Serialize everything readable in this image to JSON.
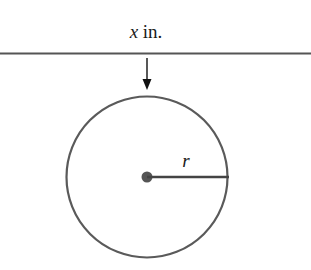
{
  "diagram": {
    "top_label_var": "x",
    "top_label_unit": " in.",
    "radius_label": "r",
    "colors": {
      "line": "#555555",
      "arrow": "#111111",
      "circle": "#5a5a5a",
      "center": "#555555",
      "text": "#1a1a1a"
    }
  }
}
